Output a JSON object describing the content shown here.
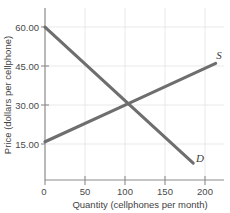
{
  "chart_data": {
    "type": "line",
    "title": "",
    "subtitle": "",
    "xlabel": "Quantity (cellphones per month)",
    "ylabel": "Price (dollars per cellphone)",
    "xlim": [
      0,
      215
    ],
    "ylim": [
      0,
      67.5
    ],
    "xticks": [
      0,
      50,
      100,
      150,
      200
    ],
    "xticklabels": [
      "0",
      "50",
      "100",
      "150",
      "200"
    ],
    "yticks": [
      15,
      30,
      45,
      60
    ],
    "yticklabels": [
      "15.00",
      "30.00",
      "45.00",
      "60.00"
    ],
    "grid": true,
    "legend": "inline-curve-labels",
    "annotations": [
      {
        "label": "S",
        "x": 209,
        "y": 47.5
      },
      {
        "label": "D",
        "x": 186,
        "y": 7.0
      }
    ],
    "equilibrium": {
      "quantity": 100,
      "price": 30.0
    },
    "series": [
      {
        "name": "D",
        "label": "D",
        "description": "Demand curve, downward sloping",
        "color": "#6e6e6e",
        "points": [
          {
            "x": 0,
            "y": 60.0
          },
          {
            "x": 100,
            "y": 30.0
          },
          {
            "x": 178,
            "y": 6.6
          }
        ]
      },
      {
        "name": "S",
        "label": "S",
        "description": "Supply curve, upward sloping",
        "color": "#6e6e6e",
        "points": [
          {
            "x": 0,
            "y": 15.0
          },
          {
            "x": 100,
            "y": 30.0
          },
          {
            "x": 205,
            "y": 45.8
          }
        ]
      }
    ],
    "colors": {
      "curve": "#6e6e6e",
      "axis": "#8c8c8c",
      "grid": "#e3e3e3",
      "text": "#3a3a3a",
      "background": "#ffffff"
    }
  }
}
